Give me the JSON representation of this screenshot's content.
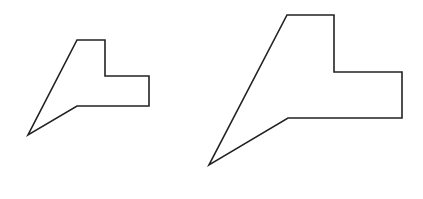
{
  "canvas": {
    "width": 423,
    "height": 199,
    "background": "#ffffff"
  },
  "stroke": {
    "color": "#222222",
    "width": 1.6
  },
  "shapes": [
    {
      "name": "small-polygon",
      "points": "77,40 105,40 105,76 149,76 149,106 77,106 28,135"
    },
    {
      "name": "large-polygon",
      "points": "287,15 334,15 334,72 402,72 402,118 288,118 209,165"
    }
  ]
}
